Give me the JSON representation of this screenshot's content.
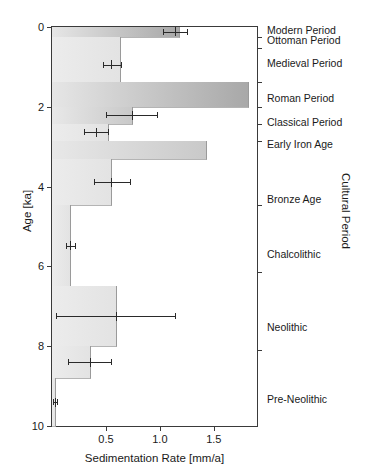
{
  "chart_data": {
    "type": "bar",
    "title": "",
    "xlabel": "Sedimentation Rate [mm/a]",
    "ylabel": "Age [ka]",
    "y2label": "Cultural Period",
    "xlim": [
      0,
      1.9
    ],
    "ylim": [
      10,
      0
    ],
    "grid": false,
    "legend": null,
    "orientation": "horizontal",
    "y_axis_inverted": true,
    "xticks": [
      {
        "value": 0.5,
        "label": "0.5"
      },
      {
        "value": 1.0,
        "label": "1.0"
      },
      {
        "value": 1.5,
        "label": "1.5"
      }
    ],
    "yticks": [
      {
        "value": 0,
        "label": "0"
      },
      {
        "value": 2,
        "label": "2"
      },
      {
        "value": 4,
        "label": "4"
      },
      {
        "value": 6,
        "label": "6"
      },
      {
        "value": 8,
        "label": "8"
      },
      {
        "value": 10,
        "label": "10"
      }
    ],
    "cultural_period_boundaries_ka": [
      0,
      0.25,
      0.52,
      1.37,
      2.0,
      2.42,
      2.85,
      4.47,
      6.15,
      8.1,
      10.0
    ],
    "cultural_periods": [
      {
        "name": "Modern Period",
        "age_top_ka": 0.0,
        "age_base_ka": 0.25,
        "label_pos_ka": 0.07
      },
      {
        "name": "Ottoman Period",
        "age_top_ka": 0.25,
        "age_base_ka": 0.52,
        "label_pos_ka": 0.33
      },
      {
        "name": "Medieval Period",
        "age_top_ka": 0.52,
        "age_base_ka": 1.37,
        "label_pos_ka": 0.9
      },
      {
        "name": "Roman Period",
        "age_top_ka": 1.37,
        "age_base_ka": 2.0,
        "label_pos_ka": 1.78
      },
      {
        "name": "Classical Period",
        "age_top_ka": 2.0,
        "age_base_ka": 2.42,
        "label_pos_ka": 2.38
      },
      {
        "name": "Early Iron Age",
        "age_top_ka": 2.42,
        "age_base_ka": 2.85,
        "label_pos_ka": 2.92
      },
      {
        "name": "Bronze Age",
        "age_top_ka": 2.85,
        "age_base_ka": 4.47,
        "label_pos_ka": 4.32
      },
      {
        "name": "Chalcolithic",
        "age_top_ka": 4.47,
        "age_base_ka": 6.15,
        "label_pos_ka": 5.7
      },
      {
        "name": "Neolithic",
        "age_top_ka": 6.15,
        "age_base_ka": 8.1,
        "label_pos_ka": 7.52
      },
      {
        "name": "Pre-Neolithic",
        "age_top_ka": 8.1,
        "age_base_ka": 10.0,
        "label_pos_ka": 9.32
      }
    ],
    "series": [
      {
        "name": "Sedimentation Rate",
        "bars": [
          {
            "period": "Modern Period",
            "age_top_ka": 0.0,
            "age_base_ka": 0.25,
            "rate": 1.18,
            "err_center": 1.14,
            "err_low": 1.03,
            "err_high": 1.25,
            "shade": "dark"
          },
          {
            "period": "Ottoman Period",
            "age_top_ka": 0.25,
            "age_base_ka": 0.52,
            "rate": 0.63,
            "err_center": null,
            "err_low": null,
            "err_high": null,
            "shade": "light"
          },
          {
            "period": "Medieval Period",
            "age_top_ka": 0.52,
            "age_base_ka": 1.37,
            "rate": 0.63,
            "err_center": 0.55,
            "err_low": 0.47,
            "err_high": 0.64,
            "shade": "light"
          },
          {
            "period": "Roman Period",
            "age_top_ka": 1.37,
            "age_base_ka": 2.0,
            "rate": 1.82,
            "err_center": null,
            "err_low": null,
            "err_high": null,
            "shade": "dark"
          },
          {
            "period": "Classical Period",
            "age_top_ka": 2.0,
            "age_base_ka": 2.42,
            "rate": 0.74,
            "err_center": 0.74,
            "err_low": 0.5,
            "err_high": 0.97,
            "shade": "medium"
          },
          {
            "period": "Early Iron Age",
            "age_top_ka": 2.42,
            "age_base_ka": 2.85,
            "rate": 0.52,
            "err_center": 0.41,
            "err_low": 0.3,
            "err_high": 0.52,
            "shade": "light"
          },
          {
            "period": "Bronze Age (upper)",
            "age_top_ka": 2.85,
            "age_base_ka": 3.3,
            "rate": 1.43,
            "err_center": null,
            "err_low": null,
            "err_high": null,
            "shade": "medium"
          },
          {
            "period": "Bronze Age (lower)",
            "age_top_ka": 3.3,
            "age_base_ka": 4.47,
            "rate": 0.55,
            "err_center": 0.55,
            "err_low": 0.39,
            "err_high": 0.72,
            "shade": "light"
          },
          {
            "period": "Chalcolithic",
            "age_top_ka": 4.47,
            "age_base_ka": 6.5,
            "rate": 0.17,
            "err_center": 0.17,
            "err_low": 0.13,
            "err_high": 0.21,
            "shade": "light"
          },
          {
            "period": "Neolithic (upper)",
            "age_top_ka": 6.5,
            "age_base_ka": 8.0,
            "rate": 0.59,
            "err_center": 0.59,
            "err_low": 0.04,
            "err_high": 1.14,
            "shade": "light"
          },
          {
            "period": "Neolithic (lower)",
            "age_top_ka": 8.0,
            "age_base_ka": 8.8,
            "rate": 0.35,
            "err_center": 0.35,
            "err_low": 0.15,
            "err_high": 0.55,
            "shade": "light"
          },
          {
            "period": "Pre-Neolithic",
            "age_top_ka": 8.8,
            "age_base_ka": 10.0,
            "rate": 0.03,
            "err_center": 0.03,
            "err_low": 0.01,
            "err_high": 0.05,
            "shade": "light"
          }
        ]
      }
    ]
  },
  "axes": {
    "x_title": "Sedimentation Rate [mm/a]",
    "y_title": "Age [ka]",
    "y2_title": "Cultural Period"
  }
}
